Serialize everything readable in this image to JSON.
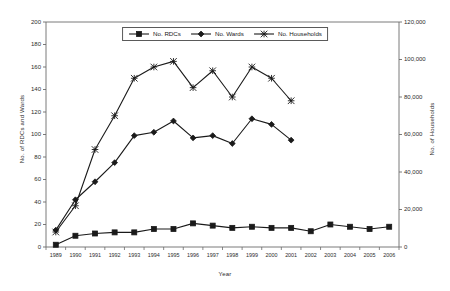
{
  "chart_data": {
    "type": "line",
    "title": "",
    "xlabel": "Year",
    "ylabel": "No. of RDCs and Wards",
    "y2label": "No. of Households",
    "grid": false,
    "legend_position": "top-center",
    "x": [
      1989,
      1990,
      1991,
      1992,
      1993,
      1994,
      1995,
      1996,
      1997,
      1998,
      1999,
      2000,
      2001,
      2002,
      2003,
      2004,
      2005,
      2006
    ],
    "categories": [
      "1989",
      "1990",
      "1991",
      "1992",
      "1993",
      "1994",
      "1995",
      "1996",
      "1997",
      "1998",
      "1999",
      "2000",
      "2001",
      "2002",
      "2003",
      "2004",
      "2005",
      "2006"
    ],
    "ylim": [
      0,
      200
    ],
    "yticks": [
      0,
      20,
      40,
      60,
      80,
      100,
      120,
      140,
      160,
      180,
      200
    ],
    "ytick_labels": [
      "0",
      "20",
      "40",
      "60",
      "80",
      "100",
      "120",
      "140",
      "160",
      "180",
      "200"
    ],
    "y2lim": [
      0,
      120000
    ],
    "y2ticks": [
      0,
      20000,
      40000,
      60000,
      80000,
      100000,
      120000
    ],
    "y2tick_labels": [
      "0",
      "20,000",
      "40,000",
      "60,000",
      "80,000",
      "100,000",
      "120,000"
    ],
    "series": [
      {
        "name": "No. RDCs",
        "axis": "left",
        "marker": "square",
        "values": [
          2,
          10,
          12,
          13,
          13,
          16,
          16,
          21,
          19,
          17,
          18,
          17,
          17,
          14,
          20,
          18,
          16,
          18
        ]
      },
      {
        "name": "No. Wards",
        "axis": "left",
        "marker": "diamond",
        "values": [
          15,
          42,
          58,
          75,
          99,
          102,
          112,
          97,
          99,
          92,
          114,
          109,
          95,
          null,
          null,
          null,
          null,
          null
        ]
      },
      {
        "name": "No. Households",
        "axis": "right",
        "marker": "cross",
        "values": [
          8000,
          22000,
          52000,
          70000,
          90000,
          96000,
          99000,
          85000,
          94000,
          80000,
          96000,
          90000,
          78000,
          null,
          null,
          null,
          null,
          null
        ]
      }
    ]
  },
  "legend": {
    "items": [
      {
        "label": "No. RDCs",
        "marker": "square-marker-icon"
      },
      {
        "label": "No. Wards",
        "marker": "diamond-marker-icon"
      },
      {
        "label": "No. Households",
        "marker": "cross-marker-icon"
      }
    ]
  },
  "colors": {
    "series_line": "#1a1a1a",
    "axis": "#6b6b6b",
    "text": "#1a1a1a",
    "background": "#ffffff"
  }
}
